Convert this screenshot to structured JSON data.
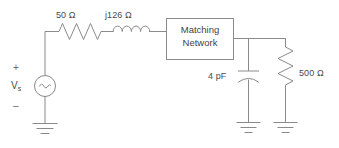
{
  "diagram": {
    "type": "circuit-schematic",
    "stroke_color": "#8a8a8a",
    "text_color": "#4a4a4a",
    "background_color": "#ffffff"
  },
  "source": {
    "label_main": "V",
    "label_sub": "s",
    "plus_sign": "+",
    "minus_sign": "–",
    "symbol": "ac-sine-source"
  },
  "series_elements": [
    {
      "name": "resistor",
      "label": "50 Ω",
      "symbol": "zigzag-resistor"
    },
    {
      "name": "inductor",
      "label": "j126 Ω",
      "symbol": "coil-inductor"
    }
  ],
  "block": {
    "line1": "Matching",
    "line2": "Network"
  },
  "shunt_elements": [
    {
      "name": "capacitor",
      "label": "4 pF",
      "symbol": "curved-plate-capacitor"
    },
    {
      "name": "load-resistor",
      "label": "500 Ω",
      "symbol": "zigzag-resistor"
    }
  ],
  "grounds": [
    {
      "name": "ground-source"
    },
    {
      "name": "ground-capacitor"
    },
    {
      "name": "ground-load"
    }
  ]
}
